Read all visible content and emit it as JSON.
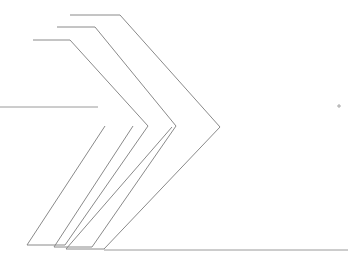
{
  "document": {
    "title": "Chevron Line Drawing",
    "background_color": "#ffffff",
    "width": 348,
    "height": 255
  },
  "style": {
    "line_color": "#8a8a8a",
    "line_color_soft": "#9a9a9a",
    "marker_color": "#9e9e9e",
    "line_width": 1
  },
  "shapes": {
    "chevron_inner": {
      "label": "inner-chevron",
      "points": "33,40 70,40 148,126 65,245 27,245 105,126"
    },
    "chevron_middle": {
      "label": "middle-chevron",
      "points": "57,27 95,27 176,126 92,247 54,247 133,126"
    },
    "chevron_outer": {
      "label": "outer-chevron",
      "points": "70,15 120,15 220,127 104,249 66,249 172,127"
    },
    "tail_left": {
      "label": "left-tail-line",
      "d": "M 0,107 L 98,107"
    },
    "tail_bottom": {
      "label": "bottom-tail-line",
      "d": "M 104,250 L 348,250"
    },
    "marker_cross": {
      "label": "cross-marker",
      "cx": 339,
      "cy": 106,
      "size": 4
    }
  }
}
